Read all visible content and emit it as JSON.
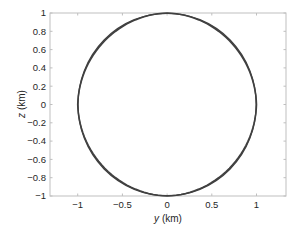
{
  "chart_data": {
    "type": "line",
    "title": "",
    "xlabel": "y (km)",
    "xlabel_var": "y",
    "xlabel_unit": " (km)",
    "ylabel": "z (km)",
    "ylabel_var": "z",
    "ylabel_unit": " (km)",
    "xlim": [
      -1.31,
      1.33
    ],
    "ylim": [
      -1,
      1
    ],
    "grid": false,
    "legend": null,
    "x_ticks": [
      -1,
      -0.5,
      0,
      0.5,
      1
    ],
    "x_tick_labels": [
      "−1",
      "−0.5",
      "0",
      "0.5",
      "1"
    ],
    "y_ticks": [
      1,
      0.8,
      0.6,
      0.4,
      0.2,
      0,
      -0.2,
      -0.4,
      -0.6,
      -0.8,
      -1
    ],
    "y_tick_labels": [
      "1",
      "0.8",
      "0.6",
      "0.4",
      "0.2",
      "0",
      "−0.2",
      "−0.4",
      "−0.6",
      "−0.8",
      "−1"
    ],
    "series": [
      {
        "name": "circle",
        "shape": "circle",
        "center": [
          0,
          0
        ],
        "radius": 1,
        "color": "#404040",
        "description": "Closed circular trajectory of unit radius (km) centered at origin; line appears thicker along diagonals"
      }
    ]
  },
  "colors": {
    "axis": "#bfbfbf",
    "text": "#262626",
    "curve": "#404040"
  }
}
